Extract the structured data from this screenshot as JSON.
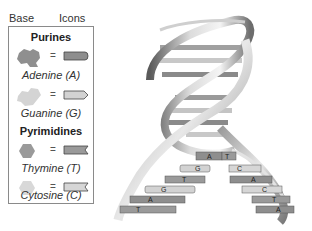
{
  "legend": {
    "header_left": "Base",
    "header_right": "Icons",
    "purines_title": "Purines",
    "pyrimidines_title": "Pyrimidines",
    "items": [
      {
        "name": "Adenine (A)",
        "icon": "adenine-block-icon",
        "color": "#8e8e8e"
      },
      {
        "name": "Guanine (G)",
        "icon": "guanine-arrow-icon",
        "color": "#d2d2d2"
      },
      {
        "name": "Thymine (T)",
        "icon": "thymine-notch-icon",
        "color": "#9a9a9a"
      },
      {
        "name": "Cytosine (C)",
        "icon": "cytosine-notch-icon",
        "color": "#d6d6d6"
      }
    ],
    "equals": "="
  },
  "helix": {
    "left_strand_bases": [
      "A",
      "G",
      "T",
      "G",
      "A",
      "T"
    ],
    "right_strand_bases": [
      "T",
      "C",
      "A",
      "C",
      "T",
      "A"
    ]
  }
}
